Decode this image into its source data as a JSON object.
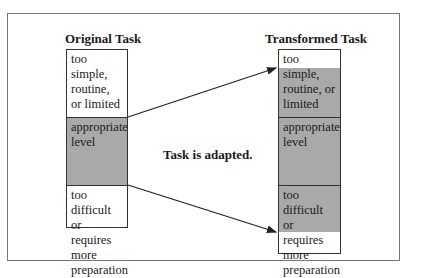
{
  "left": {
    "title": "Original Task",
    "segments": [
      "too simple, routine, or limited",
      "appropriate level",
      "too difficult or requires more preparation"
    ]
  },
  "right": {
    "title": "Transformed Task",
    "segments": [
      "too simple, routine, or limited",
      "appropriate level",
      "too difficult or requires more preparation"
    ]
  },
  "center_label": "Task is adapted.",
  "colors": {
    "shaded": "#a9a9a9",
    "unshaded": "#ffffff",
    "border": "#333333"
  }
}
